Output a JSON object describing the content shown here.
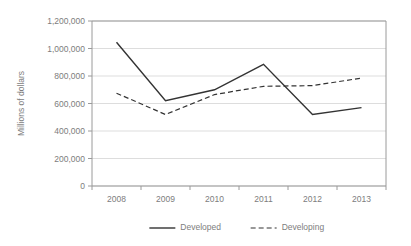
{
  "chart_data": {
    "type": "line",
    "title": "",
    "xlabel": "",
    "ylabel": "Millions of dollars",
    "categories": [
      "2008",
      "2009",
      "2010",
      "2011",
      "2012",
      "2013"
    ],
    "ylim": [
      0,
      1200000
    ],
    "yticks": [
      0,
      200000,
      400000,
      600000,
      800000,
      1000000,
      1200000
    ],
    "ytick_labels": [
      "0",
      "200,000",
      "400,000",
      "600,000",
      "800,000",
      "1,000,000",
      "1,200,000"
    ],
    "grid": true,
    "legend_position": "bottom",
    "series": [
      {
        "name": "Developed",
        "style": "solid",
        "color": "#333333",
        "values": [
          1045000,
          620000,
          700000,
          885000,
          520000,
          570000
        ]
      },
      {
        "name": "Developing",
        "style": "dashed",
        "color": "#333333",
        "values": [
          675000,
          520000,
          665000,
          725000,
          730000,
          785000
        ]
      }
    ]
  },
  "legend": {
    "items": [
      {
        "label": "Developed",
        "style": "solid"
      },
      {
        "label": "Developing",
        "style": "dashed"
      }
    ]
  }
}
